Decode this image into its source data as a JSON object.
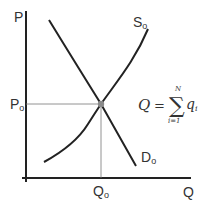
{
  "diagram": {
    "type": "supply-demand",
    "axes": {
      "y_label": "P",
      "x_label": "Q"
    },
    "curves": {
      "supply": {
        "label_main": "S",
        "label_sub": "o"
      },
      "demand": {
        "label_main": "D",
        "label_sub": "o"
      }
    },
    "equilibrium": {
      "price_label_main": "P",
      "price_label_sub": "o",
      "quantity_label_main": "Q",
      "quantity_label_sub": "o"
    },
    "formula": {
      "lhs": "Q",
      "equals": "=",
      "sum_symbol": "∑",
      "upper_limit": "N",
      "lower_limit": "i=1",
      "term_main": "q",
      "term_sub": "i"
    },
    "colors": {
      "axis": "#222222",
      "curve": "#222222",
      "guide": "#666666",
      "point": "#888888",
      "text": "#333333"
    }
  }
}
